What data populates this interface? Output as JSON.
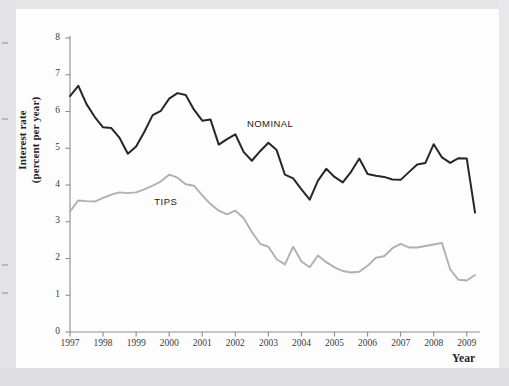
{
  "figure": {
    "axis_title_y_line1": "Interest rate",
    "axis_title_y_line2": "(percent per year)",
    "axis_title_x": "Year"
  },
  "colors": {
    "nominal_line": "#262626",
    "tips_line": "#b0b0b0",
    "axis": "#8c8c8c",
    "text": "#1f1f1f",
    "page": "#fdfdfd",
    "scan_margin": "#e3e3e5"
  },
  "chart_data": {
    "type": "line",
    "title": "",
    "subtitle": "",
    "xlabel": "Year",
    "ylabel": "Interest rate (percent per year)",
    "xlim": [
      1997,
      2009.4
    ],
    "ylim": [
      0,
      8
    ],
    "grid": false,
    "legend_position": "inline-annotation",
    "y_ticks": [
      0,
      1,
      2,
      3,
      4,
      5,
      6,
      7,
      8
    ],
    "y_tick_labels": [
      "0",
      "1",
      "2",
      "3",
      "4",
      "5",
      "6",
      "7",
      "8"
    ],
    "x_ticks": [
      1997,
      1998,
      1999,
      2000,
      2001,
      2002,
      2003,
      2004,
      2005,
      2006,
      2007,
      2008,
      2009
    ],
    "x_tick_labels": [
      "1997",
      "1998",
      "1999",
      "2000",
      "2001",
      "2002",
      "2003",
      "2004",
      "2005",
      "2006",
      "2007",
      "2008",
      "2009"
    ],
    "annotations": [
      {
        "text": "NOMINAL",
        "x": 2002.35,
        "y": 5.62
      },
      {
        "text": "TIPS",
        "x": 1999.55,
        "y": 3.52
      }
    ],
    "series": [
      {
        "name": "NOMINAL",
        "color": "#262626",
        "x": [
          1997.0,
          1997.25,
          1997.5,
          1997.75,
          1998.0,
          1998.25,
          1998.5,
          1998.75,
          1999.0,
          1999.25,
          1999.5,
          1999.75,
          2000.0,
          2000.25,
          2000.5,
          2000.75,
          2001.0,
          2001.25,
          2001.5,
          2001.75,
          2002.0,
          2002.25,
          2002.5,
          2002.75,
          2003.0,
          2003.25,
          2003.5,
          2003.75,
          2004.0,
          2004.25,
          2004.5,
          2004.75,
          2005.0,
          2005.25,
          2005.5,
          2005.75,
          2006.0,
          2006.25,
          2006.5,
          2006.75,
          2007.0,
          2007.25,
          2007.5,
          2007.75,
          2008.0,
          2008.25,
          2008.5,
          2008.75,
          2009.0,
          2009.25
        ],
        "values": [
          6.42,
          6.7,
          6.2,
          5.85,
          5.57,
          5.55,
          5.28,
          4.85,
          5.05,
          5.45,
          5.9,
          6.02,
          6.35,
          6.5,
          6.45,
          6.05,
          5.75,
          5.78,
          5.1,
          5.25,
          5.38,
          4.9,
          4.66,
          4.92,
          5.15,
          4.95,
          4.28,
          4.18,
          3.88,
          3.6,
          4.12,
          4.44,
          4.22,
          4.07,
          4.36,
          4.72,
          4.3,
          4.25,
          4.22,
          4.15,
          4.14,
          4.35,
          4.56,
          4.6,
          5.11,
          4.75,
          4.6,
          4.73,
          4.72,
          3.25
        ],
        "values_tail": [
          4.55,
          3.78,
          3.88,
          3.86,
          3.4,
          2.85,
          3.26
        ]
      },
      {
        "name": "TIPS",
        "color": "#b0b0b0",
        "x": [
          1997.0,
          1997.25,
          1997.5,
          1997.75,
          1998.0,
          1998.25,
          1998.5,
          1998.75,
          1999.0,
          1999.25,
          1999.5,
          1999.75,
          2000.0,
          2000.25,
          2000.5,
          2000.75,
          2001.0,
          2001.25,
          2001.5,
          2001.75,
          2002.0,
          2002.25,
          2002.5,
          2002.75,
          2003.0,
          2003.25,
          2003.5,
          2003.75,
          2004.0,
          2004.25,
          2004.5,
          2004.75,
          2005.0,
          2005.25,
          2005.5,
          2005.75,
          2006.0,
          2006.25,
          2006.5,
          2006.75,
          2007.0,
          2007.25,
          2007.5,
          2007.75,
          2008.0,
          2008.25,
          2008.5,
          2008.75,
          2009.0,
          2009.25
        ],
        "values": [
          3.28,
          3.58,
          3.56,
          3.55,
          3.65,
          3.74,
          3.8,
          3.78,
          3.8,
          3.88,
          3.98,
          4.1,
          4.28,
          4.2,
          4.02,
          3.98,
          3.72,
          3.48,
          3.3,
          3.2,
          3.3,
          3.1,
          2.72,
          2.4,
          2.32,
          1.98,
          1.84,
          2.32,
          1.92,
          1.76,
          2.08,
          1.9,
          1.76,
          1.66,
          1.62,
          1.64,
          1.8,
          2.02,
          2.06,
          2.28,
          2.4,
          2.3,
          2.3,
          2.34,
          2.38,
          2.42,
          1.7,
          1.42,
          1.4,
          1.55
        ],
        "values_tail": [
          1.48,
          2.88,
          1.72,
          1.55
        ]
      }
    ]
  }
}
